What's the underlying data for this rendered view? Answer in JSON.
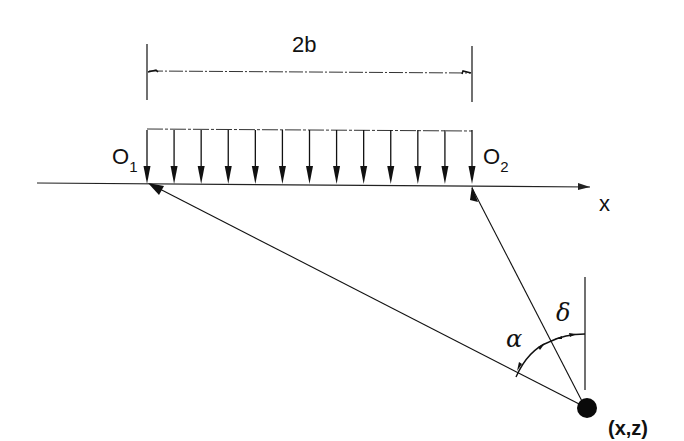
{
  "diagram": {
    "dimension_label": "2b",
    "origin_left": {
      "main": "O",
      "sub": "1"
    },
    "origin_right": {
      "main": "O",
      "sub": "2"
    },
    "axis_label": "x",
    "angle_alpha": "α",
    "angle_delta": "δ",
    "point_label": "(x,z)",
    "load_arrow_count": 13,
    "colors": {
      "ink": "#111111",
      "background": "#ffffff"
    }
  }
}
